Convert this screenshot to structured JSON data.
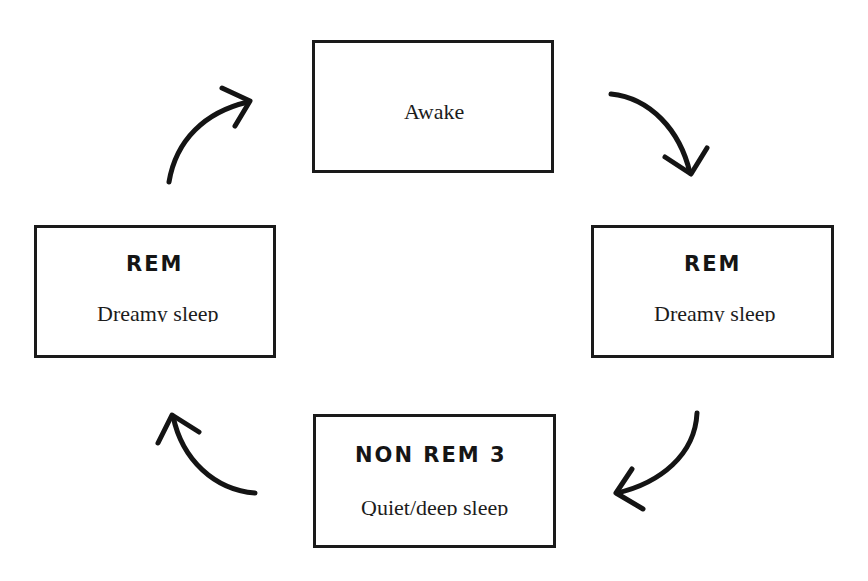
{
  "diagram": {
    "type": "sleep-cycle",
    "nodes": [
      {
        "id": "awake",
        "title": "",
        "label": "Awake"
      },
      {
        "id": "rem-right",
        "title": "REM",
        "label": "Dreamy sleep"
      },
      {
        "id": "non-rem-3",
        "title": "NON REM 3",
        "label": "Quiet/deep sleep"
      },
      {
        "id": "rem-left",
        "title": "REM",
        "label": "Dreamy sleep"
      }
    ],
    "edges": [
      {
        "from": "awake",
        "to": "rem-right"
      },
      {
        "from": "rem-right",
        "to": "non-rem-3"
      },
      {
        "from": "non-rem-3",
        "to": "rem-left"
      },
      {
        "from": "rem-left",
        "to": "awake"
      }
    ]
  },
  "awake": {
    "label": "Awake"
  },
  "rem_right": {
    "title": "REM",
    "label": "Dreamy sleep"
  },
  "non_rem": {
    "title": "NON REM 3",
    "label": "Quiet/deep sleep"
  },
  "rem_left": {
    "title": "REM",
    "label": "Dreamy sleep"
  },
  "colors": {
    "stroke": "#1a1a1a",
    "background": "#ffffff"
  }
}
